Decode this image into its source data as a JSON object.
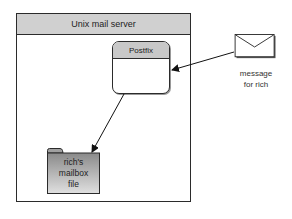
{
  "server": {
    "title": "Unix mail server"
  },
  "postfix": {
    "title": "Postfix"
  },
  "message": {
    "line1": "message",
    "line2": "for rich"
  },
  "mailbox": {
    "line1": "rich's",
    "line2": "mailbox",
    "line3": "file"
  },
  "colors": {
    "header_fill": "#d0d0d0",
    "stroke": "#2b2b2b",
    "folder_top": "#8a8a8a",
    "folder_bottom": "#e0e0e0"
  }
}
